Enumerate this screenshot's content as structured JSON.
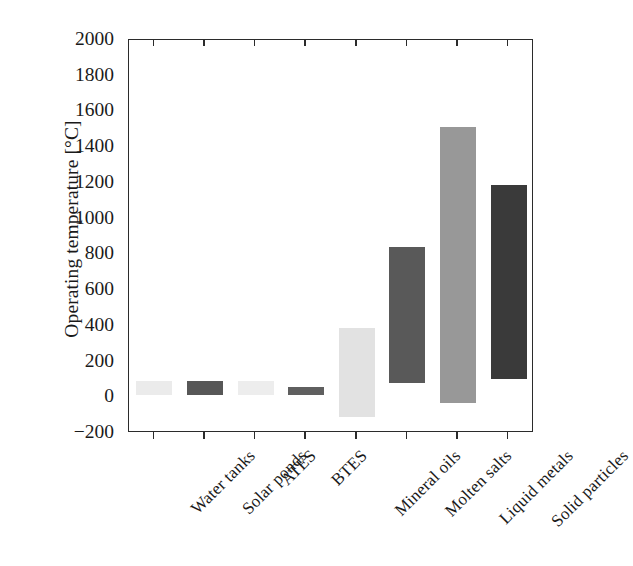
{
  "chart_data": {
    "type": "bar",
    "title": "",
    "xlabel": "",
    "ylabel": "Operating temperature [°C]",
    "ylim": [
      -200,
      2000
    ],
    "ytick_labels": [
      "2000",
      "1800",
      "1600",
      "1400",
      "1200",
      "1000",
      "800",
      "600",
      "400",
      "200",
      "0",
      "−200"
    ],
    "ytick_values": [
      2000,
      1800,
      1600,
      1400,
      1200,
      1000,
      800,
      600,
      400,
      200,
      0,
      -200
    ],
    "grid": false,
    "legend": "none",
    "categories": [
      "Water tanks",
      "Solar ponds",
      "ATES",
      "BTES",
      "Mineral oils",
      "Molten salts",
      "Liquid metals",
      "Solid particles"
    ],
    "range_low": [
      10,
      10,
      10,
      10,
      -110,
      80,
      -30,
      100
    ],
    "range_high": [
      90,
      90,
      90,
      60,
      390,
      840,
      1515,
      1190
    ],
    "bar_colors": [
      "#ebebeb",
      "#575757",
      "#ededed",
      "#5f5f5f",
      "#e2e2e2",
      "#595959",
      "#989898",
      "#3a3a3a"
    ]
  },
  "axis": {
    "y_title": "Operating temperature [°C]"
  }
}
